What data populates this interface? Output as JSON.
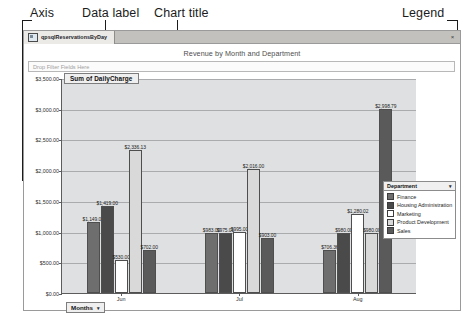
{
  "annotations": {
    "axis": "Axis",
    "data_label": "Data label",
    "chart_title": "Chart title",
    "legend": "Legend"
  },
  "window": {
    "tab_title": "qpsqlReservationsByDay",
    "close_label": "×"
  },
  "chart": {
    "title": "Revenue by Month and Department",
    "filter_placeholder": "Drop Filter Fields Here",
    "series_label": "Sum of DailyCharge",
    "months_button": "Months",
    "caret": "▾"
  },
  "legend": {
    "title": "Department",
    "caret": "▾",
    "items": [
      {
        "label": "Finance",
        "color": "#6e6e6e"
      },
      {
        "label": "Housing Administration",
        "color": "#4a4a4a"
      },
      {
        "label": "Marketing",
        "color": "#ffffff"
      },
      {
        "label": "Product Development",
        "color": "#d9d9d9"
      },
      {
        "label": "Sales",
        "color": "#5a5a5a"
      }
    ]
  },
  "chart_data": {
    "type": "bar",
    "title": "Revenue by Month and Department",
    "xlabel": "Months",
    "ylabel": "Sum of DailyCharge",
    "ylim": [
      0,
      3500
    ],
    "ytick_labels": [
      "$0.00",
      "$500.00",
      "$1,000.00",
      "$1,500.00",
      "$2,000.00",
      "$2,500.00",
      "$3,000.00",
      "$3,500.00"
    ],
    "ytick_values": [
      0,
      500,
      1000,
      1500,
      2000,
      2500,
      3000,
      3500
    ],
    "grid": true,
    "legend_position": "right",
    "categories": [
      "Jun",
      "Jul",
      "Aug"
    ],
    "series": [
      {
        "name": "Finance",
        "color": "#6e6e6e",
        "values": [
          1149.0,
          983.0,
          706.36
        ],
        "labels": [
          "$1,149.00",
          "$983.00",
          "$706.36"
        ]
      },
      {
        "name": "Housing Administration",
        "color": "#4a4a4a",
        "values": [
          1419.0,
          975.01,
          980.0
        ],
        "labels": [
          "$1,419.00",
          "$975.01",
          "$980.00"
        ]
      },
      {
        "name": "Marketing",
        "color": "#ffffff",
        "values": [
          530.0,
          995.0,
          1280.02
        ],
        "labels": [
          "$530.00",
          "$995.00",
          "$1,280.02"
        ]
      },
      {
        "name": "Product Development",
        "color": "#d9d9d9",
        "values": [
          2336.13,
          2016.0,
          980.0
        ],
        "labels": [
          "$2,336.13",
          "$2,016.00",
          "$980.00"
        ]
      },
      {
        "name": "Sales",
        "color": "#5a5a5a",
        "values": [
          702.0,
          903.0,
          2998.79
        ],
        "labels": [
          "$702.00",
          "$903.00",
          "$2,998.79"
        ]
      }
    ]
  }
}
